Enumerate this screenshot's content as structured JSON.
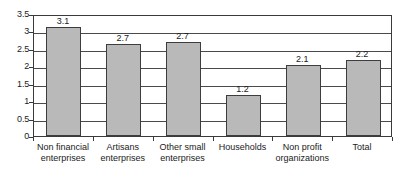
{
  "chart_data": {
    "type": "bar",
    "title": "",
    "subtitle": "",
    "xlabel": "",
    "ylabel": "",
    "ylim": [
      0,
      3.5
    ],
    "ytick_values": [
      0,
      0.5,
      1,
      1.5,
      2,
      2.5,
      3,
      3.5
    ],
    "ytick_labels": [
      "0",
      "0.5",
      "1",
      "1.5",
      "2",
      "2.5",
      "3",
      "3.5"
    ],
    "grid": true,
    "legend": false,
    "legend_position": "none",
    "categories": [
      "Non financial enterprises",
      "Artisans enterprises",
      "Other small enterprises",
      "Households",
      "Non profit organizations",
      "Total"
    ],
    "category_lines": [
      [
        "Non financial",
        "enterprises"
      ],
      [
        "Artisans",
        "enterprises"
      ],
      [
        "Other small",
        "enterprises"
      ],
      [
        "Households"
      ],
      [
        "Non profit",
        "organizations"
      ],
      [
        "Total"
      ]
    ],
    "values": [
      3.1,
      2.7,
      2.7,
      1.2,
      2.1,
      2.2
    ],
    "data_labels": [
      "3.1",
      "2.7",
      "2.7",
      "1.2",
      "2.1",
      "2.2"
    ],
    "bar_heights_plotted": [
      3.13,
      2.63,
      2.71,
      1.17,
      2.05,
      2.17
    ],
    "colors": {
      "bar_fill": "#b9b9b9",
      "bar_border": "#3d3d3d",
      "gridline": "#4a4a4a",
      "axis": "#3a3a3a",
      "text": "#1b1b1b",
      "background": "#ffffff"
    }
  }
}
